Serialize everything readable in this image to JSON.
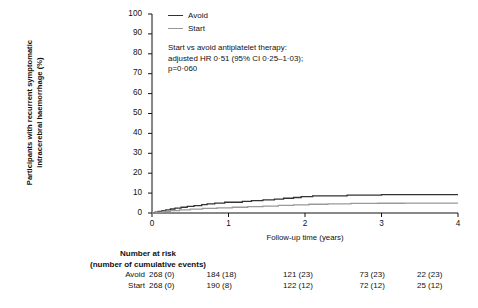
{
  "figure": {
    "y_axis_title_lines": [
      "Participants with recurrent symptomatic",
      "intracerebral haemorrhage (%)"
    ],
    "x_axis_title": "Follow-up time (years)",
    "legend": [
      {
        "label": "Avoid",
        "color": "#333333"
      },
      {
        "label": "Start",
        "color": "#999999"
      }
    ],
    "annotation_lines": [
      "Start vs avoid antiplatelet therapy:",
      "adjusted HR 0·51 (95% CI 0·25–1·03);",
      "p=0·060"
    ],
    "risk_table": {
      "title_lines": [
        "Number at risk",
        "(number of cumulative events)"
      ],
      "rows": [
        {
          "label": "Avoid",
          "cells": [
            "268 (0)",
            "184 (18)",
            "121 (23)",
            "73 (23)",
            "22 (23)"
          ]
        },
        {
          "label": "Start",
          "cells": [
            "268 (0)",
            "190 (8)",
            "122 (12)",
            "72 (12)",
            "25 (12)"
          ]
        }
      ]
    }
  },
  "chart_data": {
    "type": "line",
    "title": "",
    "xlabel": "Follow-up time (years)",
    "ylabel": "Participants with recurrent symptomatic intracerebral haemorrhage (%)",
    "xlim": [
      0,
      4
    ],
    "ylim": [
      0,
      100
    ],
    "xticks": [
      0,
      1,
      2,
      3,
      4
    ],
    "yticks": [
      0,
      10,
      20,
      30,
      40,
      50,
      60,
      70,
      80,
      90,
      100
    ],
    "grid": false,
    "legend_position": "top-left",
    "annotations": [
      "Start vs avoid antiplatelet therapy:",
      "adjusted HR 0·51 (95% CI 0·25–1·03);",
      "p=0·060"
    ],
    "series": [
      {
        "name": "Avoid",
        "color": "#333333",
        "step": true,
        "points": [
          [
            0.0,
            0.0
          ],
          [
            0.04,
            0.4
          ],
          [
            0.08,
            0.8
          ],
          [
            0.13,
            1.2
          ],
          [
            0.18,
            1.6
          ],
          [
            0.24,
            2.0
          ],
          [
            0.3,
            2.4
          ],
          [
            0.38,
            2.9
          ],
          [
            0.46,
            3.3
          ],
          [
            0.55,
            3.7
          ],
          [
            0.65,
            4.2
          ],
          [
            0.72,
            4.6
          ],
          [
            0.82,
            5.0
          ],
          [
            0.95,
            5.4
          ],
          [
            1.05,
            5.4
          ],
          [
            1.18,
            5.8
          ],
          [
            1.3,
            6.2
          ],
          [
            1.45,
            6.6
          ],
          [
            1.6,
            7.0
          ],
          [
            1.72,
            7.4
          ],
          [
            1.85,
            7.8
          ],
          [
            1.95,
            8.2
          ],
          [
            2.1,
            8.6
          ],
          [
            2.3,
            8.6
          ],
          [
            2.55,
            9.0
          ],
          [
            2.75,
            9.0
          ],
          [
            3.0,
            9.2
          ],
          [
            3.4,
            9.2
          ],
          [
            4.0,
            9.2
          ]
        ]
      },
      {
        "name": "Start",
        "color": "#999999",
        "step": true,
        "points": [
          [
            0.0,
            0.0
          ],
          [
            0.06,
            0.4
          ],
          [
            0.14,
            0.8
          ],
          [
            0.24,
            1.2
          ],
          [
            0.36,
            1.6
          ],
          [
            0.5,
            1.9
          ],
          [
            0.66,
            2.3
          ],
          [
            0.85,
            2.6
          ],
          [
            1.05,
            2.9
          ],
          [
            1.25,
            3.2
          ],
          [
            1.45,
            3.5
          ],
          [
            1.65,
            3.8
          ],
          [
            1.85,
            4.1
          ],
          [
            2.05,
            4.4
          ],
          [
            2.3,
            4.6
          ],
          [
            2.6,
            4.8
          ],
          [
            2.95,
            4.9
          ],
          [
            3.3,
            5.0
          ],
          [
            3.7,
            5.0
          ],
          [
            4.0,
            5.0
          ]
        ]
      }
    ],
    "risk_table": {
      "x": [
        0,
        1,
        2,
        3,
        4
      ],
      "rows": [
        {
          "name": "Avoid",
          "at_risk": [
            268,
            184,
            121,
            73,
            22
          ],
          "cumulative_events": [
            0,
            18,
            23,
            23,
            23
          ]
        },
        {
          "name": "Start",
          "at_risk": [
            268,
            190,
            122,
            72,
            25
          ],
          "cumulative_events": [
            0,
            8,
            12,
            12,
            12
          ]
        }
      ]
    }
  }
}
